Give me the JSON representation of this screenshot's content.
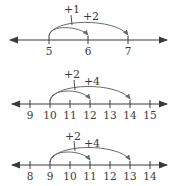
{
  "colors": {
    "line": "#3a3a3a",
    "arc": "#6a6a6a",
    "background": "#ffffff"
  },
  "number_lines": [
    {
      "id": "line-1",
      "ticks": [
        "5",
        "6",
        "7"
      ],
      "start": "5",
      "jumps": [
        {
          "label": "+1",
          "from": "5",
          "to": "6"
        },
        {
          "label": "+2",
          "from": "5",
          "to": "7"
        }
      ]
    },
    {
      "id": "line-2",
      "ticks": [
        "9",
        "10",
        "11",
        "12",
        "13",
        "14",
        "15"
      ],
      "start": "10",
      "jumps": [
        {
          "label": "+2",
          "from": "10",
          "to": "12"
        },
        {
          "label": "+4",
          "from": "10",
          "to": "14"
        }
      ]
    },
    {
      "id": "line-3",
      "ticks": [
        "8",
        "9",
        "10",
        "11",
        "12",
        "13",
        "14"
      ],
      "start": "9",
      "jumps": [
        {
          "label": "+2",
          "from": "9",
          "to": "11"
        },
        {
          "label": "+4",
          "from": "9",
          "to": "13"
        }
      ]
    }
  ]
}
